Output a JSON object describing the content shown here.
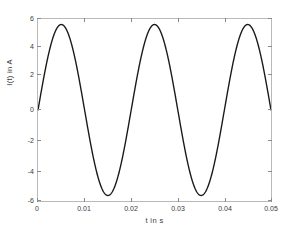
{
  "chart_data": {
    "type": "line",
    "title": "",
    "subtitle": "",
    "xlabel": "t in s",
    "ylabel": "I(t) in A",
    "xlim": [
      0,
      0.05
    ],
    "ylim": [
      -6.6,
      6.6
    ],
    "grid": false,
    "legend": null,
    "line_color": "#1a1a1a",
    "axis_color": "#b9b9b9",
    "background_color": "#ffffff",
    "xticks": [
      "0",
      "0.01",
      "0.02",
      "0.03",
      "0.04",
      "0.05"
    ],
    "xtick_values": [
      0,
      0.01,
      0.02,
      0.03,
      0.04,
      0.05
    ],
    "yticks": [
      "6",
      "4",
      "2",
      "0",
      "-2",
      "-4",
      "-6"
    ],
    "ytick_values": [
      6,
      4,
      2,
      0,
      -2,
      -4,
      -6
    ],
    "series": [
      {
        "name": "I(t)",
        "amplitude": 6.2,
        "frequency_hz": 50,
        "phase_rad": 0,
        "x": [
          0,
          0.001,
          0.002,
          0.003,
          0.004,
          0.005,
          0.006,
          0.007,
          0.008,
          0.009,
          0.01,
          0.011,
          0.012,
          0.013,
          0.014,
          0.015,
          0.016,
          0.017,
          0.018,
          0.019,
          0.02,
          0.021,
          0.022,
          0.023,
          0.024,
          0.025,
          0.026,
          0.027,
          0.028,
          0.029,
          0.03,
          0.031,
          0.032,
          0.033,
          0.034,
          0.035,
          0.036,
          0.037,
          0.038,
          0.039,
          0.04,
          0.041,
          0.042,
          0.043,
          0.044,
          0.045,
          0.046,
          0.047,
          0.048,
          0.049,
          0.05
        ],
        "values": [
          0,
          1.92,
          3.65,
          5.01,
          5.9,
          6.2,
          5.9,
          5.01,
          3.65,
          1.92,
          0,
          -1.92,
          -3.65,
          -5.01,
          -5.9,
          -6.2,
          -5.9,
          -5.01,
          -3.65,
          -1.92,
          0,
          1.92,
          3.65,
          5.01,
          5.9,
          6.2,
          5.9,
          5.01,
          3.65,
          1.92,
          0,
          -1.92,
          -3.65,
          -5.01,
          -5.9,
          -6.2,
          -5.9,
          -5.01,
          -3.65,
          -1.92,
          0,
          1.92,
          3.65,
          5.01,
          5.9,
          6.2,
          5.9,
          5.01,
          3.65,
          1.92,
          0.1
        ]
      }
    ]
  }
}
